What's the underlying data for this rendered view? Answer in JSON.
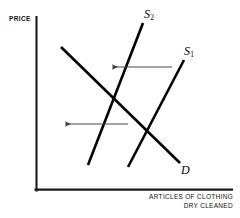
{
  "figure": {
    "kind": "economics-supply-demand-diagram",
    "background_color": "#ffffff",
    "ink_color": "#000000",
    "arrow_color": "#4a4a4a"
  },
  "axes": {
    "y_axis_label": "PRICE",
    "x_axis_label_line1": "ARTICLES OF CLOTHING",
    "x_axis_label_line2": "DRY CLEANED",
    "origin": {
      "x": 36,
      "y": 190
    },
    "y_axis_top": 17,
    "x_axis_right": 232,
    "stroke_width": 2
  },
  "curve_labels": {
    "supply_shifted": "S",
    "supply_shifted_sub": "2",
    "supply_original": "S",
    "supply_original_sub": "1",
    "demand": "D"
  },
  "chart_data": {
    "type": "line",
    "title": "",
    "xlabel": "ARTICLES OF CLOTHING DRY CLEANED",
    "ylabel": "PRICE",
    "grid": false,
    "legend": "inline-curve-labels",
    "xlim": [
      36,
      232
    ],
    "ylim": [
      190,
      17
    ],
    "note": "Leftward shift of supply from S1 to S2; equilibrium quantity falls, price rises.",
    "series": [
      {
        "name": "S2",
        "role": "supply-after-shift",
        "label": "S₂",
        "color": "#000000",
        "stroke_width": 2.6,
        "points": [
          {
            "x": 88,
            "y": 165
          },
          {
            "x": 143,
            "y": 23
          }
        ]
      },
      {
        "name": "S1",
        "role": "supply-original",
        "label": "S₁",
        "color": "#000000",
        "stroke_width": 2.6,
        "points": [
          {
            "x": 128,
            "y": 167
          },
          {
            "x": 184,
            "y": 60
          }
        ]
      },
      {
        "name": "D",
        "role": "demand",
        "label": "D",
        "color": "#000000",
        "stroke_width": 2.6,
        "points": [
          {
            "x": 61,
            "y": 47
          },
          {
            "x": 180,
            "y": 163
          }
        ]
      }
    ],
    "annotations": [
      {
        "name": "supply-shift-arrow",
        "type": "arrow",
        "direction": "left",
        "from": {
          "x": 172,
          "y": 67
        },
        "to": {
          "x": 112,
          "y": 67
        },
        "color": "#4a4a4a"
      },
      {
        "name": "quantity-decrease-arrow",
        "type": "arrow",
        "direction": "left",
        "from": {
          "x": 128,
          "y": 124
        },
        "to": {
          "x": 65,
          "y": 124
        },
        "color": "#4a4a4a"
      }
    ]
  }
}
